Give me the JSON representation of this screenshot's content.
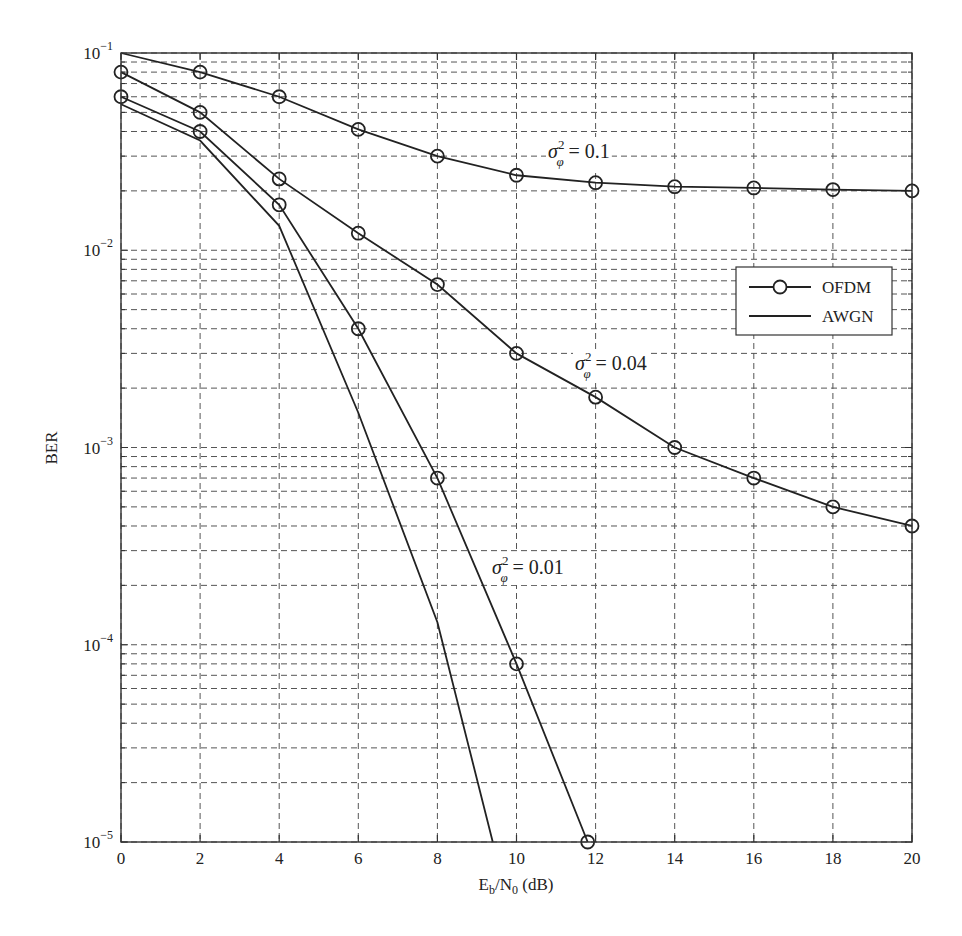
{
  "chart_data": {
    "type": "line",
    "title": "",
    "xlabel": "Eb/N0 (dB)",
    "xlabel_parts": {
      "main": "E",
      "sub1": "b",
      "mid": "/N",
      "sub2": "0",
      "tail": " (dB)"
    },
    "ylabel": "BER",
    "xlim": [
      0,
      20
    ],
    "ylim": [
      1e-05,
      0.1
    ],
    "yscale": "log",
    "grid": true,
    "x_ticks": [
      0,
      2,
      4,
      6,
      8,
      10,
      12,
      14,
      16,
      18,
      20
    ],
    "y_ticks": [
      {
        "value": 0.1,
        "base": "10",
        "exp": "−1"
      },
      {
        "value": 0.01,
        "base": "10",
        "exp": "−2"
      },
      {
        "value": 0.001,
        "base": "10",
        "exp": "−3"
      },
      {
        "value": 0.0001,
        "base": "10",
        "exp": "−4"
      },
      {
        "value": 1e-05,
        "base": "10",
        "exp": "−5"
      }
    ],
    "legend": {
      "position": "right-middle",
      "entries": [
        {
          "label": "OFDM",
          "marker": "circle",
          "line": "solid"
        },
        {
          "label": "AWGN",
          "marker": "none",
          "line": "solid"
        }
      ]
    },
    "series": [
      {
        "name": "OFDM, σφ² = 0.1",
        "legend_group": "OFDM",
        "marker": "circle",
        "line_start": [
          0,
          0.1
        ],
        "x": [
          2,
          4,
          6,
          8,
          10,
          12,
          14,
          16,
          18,
          20
        ],
        "values": [
          0.08,
          0.06,
          0.041,
          0.03,
          0.024,
          0.022,
          0.021,
          0.0207,
          0.0203,
          0.02
        ]
      },
      {
        "name": "OFDM, σφ² = 0.04",
        "legend_group": "OFDM",
        "marker": "circle",
        "x": [
          0,
          2,
          4,
          6,
          8,
          10,
          12,
          14,
          16,
          18,
          20
        ],
        "values": [
          0.08,
          0.05,
          0.023,
          0.0122,
          0.0067,
          0.003,
          0.0018,
          0.001,
          0.0007,
          0.0005,
          0.0004
        ]
      },
      {
        "name": "OFDM, σφ² = 0.01",
        "legend_group": "OFDM",
        "marker": "circle",
        "x": [
          0,
          2,
          4,
          6,
          8,
          10,
          11.8
        ],
        "values": [
          0.06,
          0.04,
          0.017,
          0.004,
          0.0007,
          8e-05,
          1e-05
        ]
      },
      {
        "name": "AWGN",
        "legend_group": "AWGN",
        "marker": "none",
        "x": [
          0,
          2,
          4,
          6,
          8,
          9.4
        ],
        "values": [
          0.055,
          0.036,
          0.0133,
          0.0015,
          0.00013,
          1e-05
        ]
      }
    ],
    "annotations": [
      {
        "prefix": "σ",
        "sup": "2",
        "sub": "φ",
        "text": " = 0.1",
        "x_px": 548,
        "y_px": 158
      },
      {
        "prefix": "σ",
        "sup": "2",
        "sub": "φ",
        "text": " = 0.04",
        "x_px": 575,
        "y_px": 370
      },
      {
        "prefix": "σ",
        "sup": "2",
        "sub": "φ",
        "text": " = 0.01",
        "x_px": 492,
        "y_px": 574
      }
    ]
  },
  "colors": {
    "line": "#222222",
    "grid": "#555555",
    "axis": "#333333",
    "background": "#ffffff"
  },
  "layout": {
    "plot_left": 121,
    "plot_right": 912,
    "plot_top": 53,
    "plot_bottom": 842,
    "legend_box": {
      "x": 736,
      "y": 267,
      "w": 156,
      "h": 68
    }
  }
}
